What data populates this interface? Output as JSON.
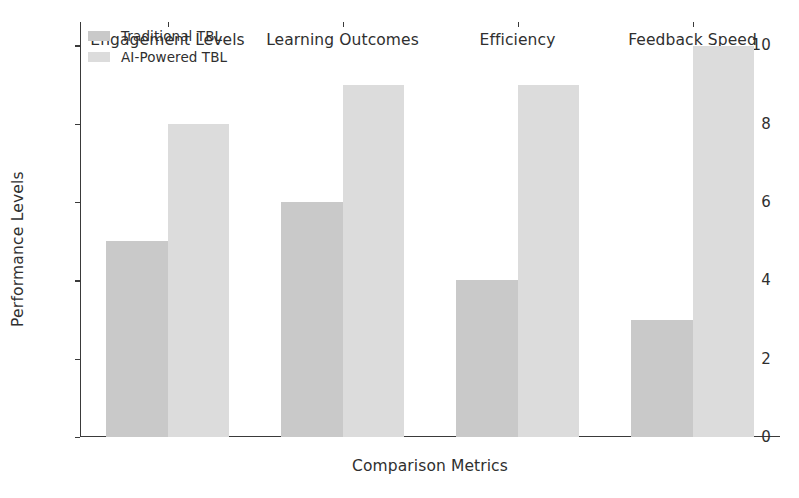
{
  "chart_data": {
    "type": "bar",
    "title": "",
    "subtitle": "",
    "xlabel": "Comparison Metrics",
    "ylabel": "Performance Levels",
    "categories": [
      "Engagement Levels",
      "Learning Outcomes",
      "Efficiency",
      "Feedback Speed"
    ],
    "series": [
      {
        "name": "Traditional TBL",
        "values": [
          5,
          6,
          4,
          3
        ],
        "color": "#c9c9c9"
      },
      {
        "name": "AI-Powered TBL",
        "values": [
          8,
          9,
          9,
          10
        ],
        "color": "#dcdcdc"
      }
    ],
    "ylim": [
      0,
      10.6
    ],
    "yticks": [
      0,
      2,
      4,
      6,
      8,
      10
    ],
    "ytick_labels": [
      "0",
      "2",
      "4",
      "6",
      "8",
      "10"
    ],
    "grid": false,
    "legend_position": "upper left",
    "spines": [
      "left",
      "bottom"
    ],
    "background": "#ffffff",
    "axis_color": "#3a3a3a",
    "text_color": "#2f2f2f"
  },
  "legend": {
    "entries": [
      {
        "label": "Traditional TBL"
      },
      {
        "label": "AI-Powered TBL"
      }
    ]
  }
}
